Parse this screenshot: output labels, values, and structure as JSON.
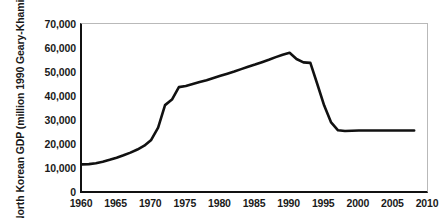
{
  "chart_data": {
    "type": "line",
    "title": "",
    "xlabel": "",
    "ylabel": "North Korean GDP (million 1990 Geary-Khamis $)",
    "xlim": [
      1960,
      2010
    ],
    "ylim": [
      0,
      70000
    ],
    "xticks": [
      1960,
      1965,
      1970,
      1975,
      1980,
      1985,
      1990,
      1995,
      2000,
      2005,
      2010
    ],
    "xtick_labels": [
      "1960",
      "1965",
      "1970",
      "1975",
      "1980",
      "1985",
      "1990",
      "1995",
      "2000",
      "2005",
      "2010"
    ],
    "yticks": [
      0,
      10000,
      20000,
      30000,
      40000,
      50000,
      60000,
      70000
    ],
    "ytick_labels": [
      "0",
      "10,000",
      "20,000",
      "30,000",
      "40,000",
      "50,000",
      "60,000",
      "70,000"
    ],
    "grid": false,
    "legend": null,
    "line_color": "#111111",
    "line_width": 2.6,
    "series": [
      {
        "name": "North Korean GDP",
        "x": [
          1960,
          1961,
          1962,
          1963,
          1964,
          1965,
          1966,
          1967,
          1968,
          1969,
          1970,
          1971,
          1972,
          1973,
          1974,
          1975,
          1976,
          1977,
          1978,
          1979,
          1980,
          1981,
          1982,
          1983,
          1984,
          1985,
          1986,
          1987,
          1988,
          1989,
          1990,
          1991,
          1992,
          1993,
          1994,
          1995,
          1996,
          1997,
          1998,
          1999,
          2000,
          2001,
          2002,
          2003,
          2004,
          2005,
          2006,
          2007,
          2008
        ],
        "y": [
          11500,
          11600,
          12000,
          12600,
          13400,
          14300,
          15300,
          16400,
          17700,
          19300,
          21700,
          26800,
          36200,
          38500,
          43700,
          44200,
          45000,
          45800,
          46600,
          47500,
          48400,
          49300,
          50200,
          51200,
          52200,
          53100,
          54100,
          55100,
          56200,
          57200,
          58000,
          55400,
          54000,
          53800,
          45000,
          36000,
          29000,
          25700,
          25400,
          25500,
          25600,
          25600,
          25600,
          25600,
          25600,
          25600,
          25600,
          25600,
          25600
        ]
      }
    ]
  }
}
